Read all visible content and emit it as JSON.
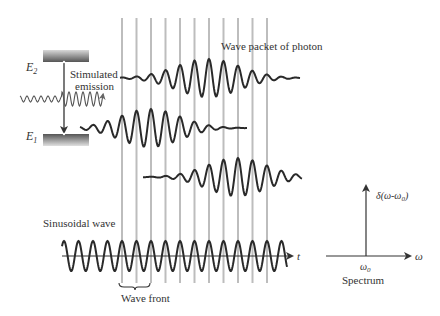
{
  "labels": {
    "e2": "E",
    "e2_sub": "2",
    "e1": "E",
    "e1_sub": "1",
    "stimulated_line1": "Stimulated",
    "stimulated_line2": "emission",
    "wave_packet": "Wave packet of photon",
    "sinusoidal": "Sinusoidal wave",
    "wave_front": "Wave front",
    "t_axis": "t",
    "omega_axis": "ω",
    "omega0": "ω",
    "omega0_sub": "0",
    "delta": "δ(ω-ω",
    "delta_sub": "0",
    "delta_close": ")",
    "spectrum": "Spectrum"
  },
  "colors": {
    "wave": "#2a2a2a",
    "grid": "#bdbdbd",
    "text": "#333333",
    "incident": "#555555"
  },
  "wavefront_count": 11,
  "packets": [
    {
      "name": "packet-top",
      "description": "emitted photon wave packet"
    },
    {
      "name": "packet-middle",
      "description": "earlier wave packet"
    },
    {
      "name": "packet-lower",
      "description": "later wave packet"
    }
  ]
}
